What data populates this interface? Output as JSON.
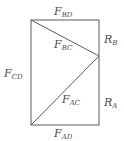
{
  "diagram": {
    "type": "truss",
    "colors": {
      "line": "#5a5a5a",
      "text": "#4a4a4a"
    },
    "nodes": {
      "A": {
        "x": 31,
        "y": 125
      },
      "B": {
        "x": 99,
        "y": 20
      },
      "C": {
        "x": 99,
        "y": 56
      },
      "D": {
        "x": 31,
        "y": 20
      }
    },
    "labels": {
      "F_BD": {
        "main": "F",
        "sub": "BD"
      },
      "F_BC": {
        "main": "F",
        "sub": "BC"
      },
      "F_CD": {
        "main": "F",
        "sub": "CD"
      },
      "F_AC": {
        "main": "F",
        "sub": "AC"
      },
      "F_AD": {
        "main": "F",
        "sub": "AD"
      },
      "R_B": {
        "main": "R",
        "sub": "B"
      },
      "R_A": {
        "main": "R",
        "sub": "A"
      }
    }
  }
}
